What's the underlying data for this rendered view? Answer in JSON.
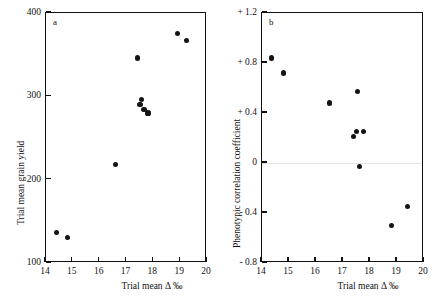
{
  "figure": {
    "panels": [
      {
        "tag": "a",
        "xlabel": "Trial mean Δ ‰",
        "ylabel": "Trial mean grain yield",
        "xticks": [
          "14",
          "15",
          "16",
          "17",
          "18",
          "19",
          "20"
        ],
        "yticks": [
          "400",
          "300",
          "200",
          "100"
        ]
      },
      {
        "tag": "b",
        "xlabel": "Trial mean Δ ‰",
        "ylabel": "Phenotypic correlation coefficient",
        "xticks": [
          "14",
          "15",
          "16",
          "17",
          "18",
          "19",
          "20"
        ],
        "yticks": [
          "+ 1.2",
          "+ 0.8",
          "+ 0.4",
          "0",
          "- 0.4",
          "- 0.8"
        ]
      }
    ]
  },
  "chart_data": [
    {
      "type": "scatter",
      "panel": "a",
      "title": "",
      "xlabel": "Trial mean Δ ‰",
      "ylabel": "Trial mean grain yield",
      "xlim": [
        14,
        20
      ],
      "ylim": [
        100,
        400
      ],
      "xticks": [
        14,
        15,
        16,
        17,
        18,
        19,
        20
      ],
      "yticks": [
        100,
        200,
        300,
        400
      ],
      "grid": false,
      "legend": null,
      "marker": "filled-circle",
      "marker_color": "#141414",
      "points": [
        {
          "x": 14.4,
          "y": 137
        },
        {
          "x": 14.8,
          "y": 131
        },
        {
          "x": 16.6,
          "y": 218
        },
        {
          "x": 17.4,
          "y": 346
        },
        {
          "x": 17.5,
          "y": 290
        },
        {
          "x": 17.55,
          "y": 296
        },
        {
          "x": 17.65,
          "y": 284
        },
        {
          "x": 17.8,
          "y": 280
        },
        {
          "x": 18.9,
          "y": 375
        },
        {
          "x": 19.25,
          "y": 367
        }
      ]
    },
    {
      "type": "scatter",
      "panel": "b",
      "title": "",
      "xlabel": "Trial mean Δ ‰",
      "ylabel": "Phenotypic correlation coefficient",
      "xlim": [
        14,
        20
      ],
      "ylim": [
        -0.8,
        1.2
      ],
      "xticks": [
        14,
        15,
        16,
        17,
        18,
        19,
        20
      ],
      "yticks": [
        -0.8,
        -0.4,
        0,
        0.4,
        0.8,
        1.2
      ],
      "grid": false,
      "zero_line": 0,
      "legend": null,
      "marker": "filled-circle",
      "marker_color": "#141414",
      "points": [
        {
          "x": 14.35,
          "y": 0.84
        },
        {
          "x": 14.8,
          "y": 0.72
        },
        {
          "x": 16.5,
          "y": 0.48
        },
        {
          "x": 17.4,
          "y": 0.21
        },
        {
          "x": 17.5,
          "y": 0.25
        },
        {
          "x": 17.55,
          "y": 0.57
        },
        {
          "x": 17.75,
          "y": 0.25
        },
        {
          "x": 17.6,
          "y": -0.03
        },
        {
          "x": 18.8,
          "y": -0.5
        },
        {
          "x": 19.4,
          "y": -0.35
        }
      ]
    }
  ]
}
